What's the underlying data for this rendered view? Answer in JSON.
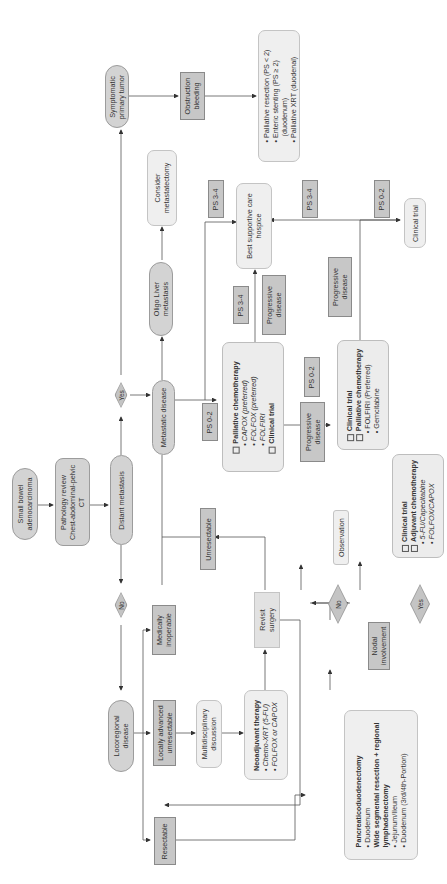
{
  "diagram": {
    "nodes": {
      "start": "Small bowel adenocarcinoma",
      "start_l1": "Small bowel",
      "start_l2": "adenocarcinoma",
      "workup_l1": "Pathology review",
      "workup_l2": "Chest-abdominal-pelvic",
      "workup_l3": "CT",
      "distant_mets": "Distant metastasis",
      "yes_upper": "Yes",
      "no_lower": "No",
      "symptomatic_l1": "Symptomatic",
      "symptomatic_l2": "primary tumor",
      "obstruction_l1": "Obstruction",
      "obstruction_l2": "bleeding",
      "palliative_options": [
        "• Palliative resection (PS < 2)",
        "• Enteric stenting (PS ≥ 2)",
        "  (duodenum)",
        "• Palliative XRT (duodenal)"
      ],
      "metastatic_disease": "Metastatic disease",
      "oligo_l1": "Oligo Liver",
      "oligo_l2": "metastasis",
      "metastatectomy_l1": "Consider",
      "metastatectomy_l2": "metastatectomy",
      "ps34_a": "PS 3-4",
      "ps34_b": "PS 3-4",
      "ps34_c": "PS 3-4",
      "ps02_a": "PS 0-2",
      "ps02_b": "PS 0-2",
      "ps02_c": "PS 0-2",
      "bsc_l1": "Best supportive care",
      "bsc_l2": "hospice",
      "progressive_a_l1": "Progressive",
      "progressive_a_l2": "disease",
      "progressive_b_l1": "Progressive",
      "progressive_b_l2": "disease",
      "progressive_c_l1": "Progressive",
      "progressive_c_l2": "disease",
      "first_line": {
        "title": "Palliative chemotherapy",
        "items": [
          "• CAPOX (preferred)",
          "• FOLFOX (preferred)",
          "• FOLFIRI"
        ],
        "trial": "Clinical trial"
      },
      "second_line": {
        "trial": "Clinical trial",
        "title": "Palliative chemotherapy",
        "items": [
          "• FOLFIRI (Preferred)",
          "• Gemcitabine"
        ]
      },
      "clinical_trial_end": "Clinical trial",
      "locoregional_l1": "Locoregional",
      "locoregional_l2": "disease",
      "medically_inoperable_l1": "Medically",
      "medically_inoperable_l2": "inoperable",
      "unresectable": "Unresectable",
      "locally_advanced_l1": "Locally advanced",
      "locally_advanced_l2": "unresectable",
      "mdt_l1": "Multidisciplinary",
      "mdt_l2": "discussion",
      "neoadjuvant": {
        "title": "Neoadjuvant therapy",
        "items": [
          "• Chemo-XRT (5-FU)",
          "• FOLFOX or CAPOX"
        ]
      },
      "revisit_l1": "Revisit",
      "revisit_l2": "surgery",
      "resectable": "Resectable",
      "surgery": {
        "title1": "Pancreaticoduodenectomy",
        "item1": "• Duodenum",
        "title2": "Wide segmental resection + regional",
        "title2b": "lymphadenectomy",
        "item2": "• Jejunum/Ileum",
        "item3": "• Duodenum (3rd/4th-Portion)"
      },
      "nodal_l1": "Nodal",
      "nodal_l2": "involvement",
      "no_nodal": "No",
      "yes_nodal": "Yes",
      "observation": "Observation",
      "adjuvant": {
        "trial": "Clinical trial",
        "title": "Adjuvant chemotherapy",
        "items": [
          "• 5-FU/Capecitabine",
          "• FOLFOX/CAPOX"
        ]
      }
    },
    "colors": {
      "pill_fill": "#d3d3d3",
      "box_fill": "#efefef",
      "square_fill": "#c7c7c7",
      "line": "#555555"
    }
  }
}
